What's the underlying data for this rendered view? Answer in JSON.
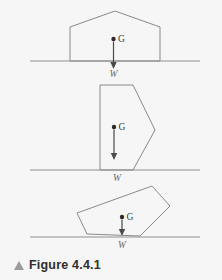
{
  "figure": {
    "caption_marker": "triangle-up-marker",
    "caption_label": "Figure 4.4.1",
    "background_color": "#f6f6f6",
    "outline_color": "#8a8a8a",
    "ground_color": "#8f8f8f",
    "arrow_color": "#4a4a4a",
    "dot_color": "#2b2b2b",
    "marker_color": "#9b9b9b"
  },
  "panels": [
    {
      "name": "house-pentagon-panel",
      "shape_label": "house-shaped-pentagon",
      "points": "70,61 70,27 115,11 160,27 160,61",
      "ground": {
        "x1": 30,
        "y1": 61,
        "x2": 200,
        "y2": 61
      },
      "cg": {
        "x": 113.5,
        "y": 39,
        "label": "G",
        "label_x": 118,
        "label_y": 42
      },
      "arrow": {
        "x": 113.5,
        "y1": 41.5,
        "y2": 66
      },
      "weight": {
        "label": "W",
        "x": 113.5,
        "y": 77
      }
    },
    {
      "name": "arrow-polygon-panel",
      "shape_label": "concave-arrow-polygon",
      "points": "100,170 100,85 133,85 155,130 133,170",
      "ground": {
        "x1": 30,
        "y1": 170,
        "x2": 200,
        "y2": 170
      },
      "cg": {
        "x": 114,
        "y": 127,
        "label": "G",
        "label_x": 118.5,
        "label_y": 130
      },
      "arrow": {
        "x": 114,
        "y1": 129.5,
        "y2": 157
      },
      "weight": {
        "label": "W",
        "x": 117,
        "y": 181
      }
    },
    {
      "name": "tilted-quadrilateral-panel",
      "shape_label": "tilted-quadrilateral",
      "points": "87,234 77,213 152,186 170,206 140,236",
      "ground": {
        "x1": 30,
        "y1": 237,
        "x2": 200,
        "y2": 237
      },
      "cg": {
        "x": 122,
        "y": 217,
        "label": "G",
        "label_x": 126.5,
        "label_y": 220
      },
      "arrow": {
        "x": 122,
        "y1": 219.5,
        "y2": 235
      },
      "weight": {
        "label": "W",
        "x": 122,
        "y": 248
      }
    }
  ]
}
